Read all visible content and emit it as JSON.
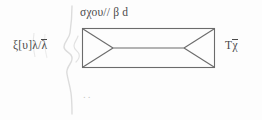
{
  "figure": {
    "background_color": "#fdfdfd",
    "ink_color": "#4a4a4a",
    "faint_ink_color": "#d8d8d8",
    "labels": {
      "top": "σχου// β d",
      "left_main": "ξ[υ]λ",
      "left_slash": "/",
      "left_overlined": "λ",
      "right_first": "Τ",
      "right_overlined": "χ",
      "bottom_dots": ".."
    },
    "shapes": {
      "box": {
        "name": "rectangle",
        "x": 82,
        "y": 28,
        "width": 133,
        "height": 40
      },
      "center_line": {
        "name": "horizontal-center-line",
        "y": 48
      },
      "left_wedge": {
        "name": "left-triangle-wedge",
        "apex_x": 113
      },
      "right_wedge": {
        "name": "right-triangle-wedge",
        "apex_x": 184
      },
      "wavy_line": {
        "name": "vertical-wavy-stroke",
        "x": 70,
        "y_start": 8,
        "y_end": 112
      }
    }
  }
}
